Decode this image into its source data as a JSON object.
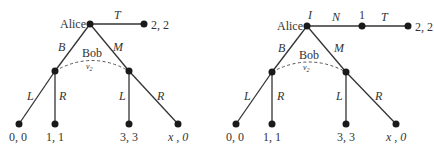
{
  "left_tree": {
    "root_player": "Alice",
    "info_set_player": "Bob",
    "info_set_label": "ν",
    "info_set_sub": "2",
    "actions": {
      "top": "T",
      "left": "B",
      "right": "M"
    },
    "bob_actions": {
      "ll": "L",
      "lr": "R",
      "rl": "L",
      "rr": "R"
    },
    "payoffs": {
      "top": "2, 2",
      "ll": "0, 0",
      "lr": "1, 1",
      "rl": "3, 3",
      "rr": "x , 0"
    }
  },
  "right_tree": {
    "root_player": "Alice",
    "root_label": "I",
    "mid_node_label": "1",
    "info_set_player": "Bob",
    "info_set_label": "ν",
    "info_set_sub": "2",
    "actions": {
      "first": "N",
      "second": "T",
      "left": "B",
      "right": "M"
    },
    "bob_actions": {
      "ll": "L",
      "lr": "R",
      "rl": "L",
      "rr": "R"
    },
    "payoffs": {
      "top": "2, 2",
      "ll": "0, 0",
      "lr": "1, 1",
      "rl": "3, 3",
      "rr": "x , 0"
    }
  }
}
